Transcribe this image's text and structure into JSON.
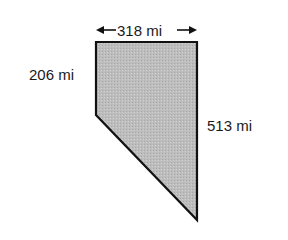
{
  "diagram": {
    "shape": "quadrilateral",
    "fill_color": "#bdbdbd",
    "stroke_color": "#111111",
    "labels": {
      "top": "318 mi",
      "left": "206 mi",
      "right": "513 mi"
    },
    "top_dimension_arrows": true
  }
}
